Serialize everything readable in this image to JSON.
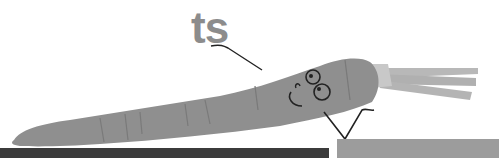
{
  "caption": {
    "text": "ts"
  },
  "colors": {
    "background": "#ffffff",
    "text": "#8c8c8c",
    "carrot_body": "#8f8f8f",
    "carrot_shade": "#7a7a7a",
    "carrot_tops": "#b4b4b4",
    "ink": "#222222",
    "bar_left": "#3b3b3b",
    "bar_right": "#9c9c9c"
  },
  "character": {
    "name": "carrot",
    "face": [
      "left-eye",
      "right-eye",
      "smile",
      "cheek"
    ]
  }
}
